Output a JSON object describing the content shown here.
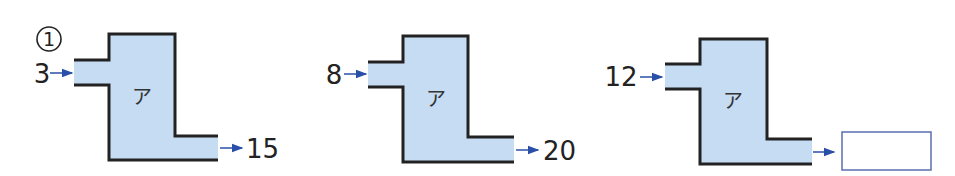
{
  "problem_number": "①",
  "fill_color": "#c5dcf3",
  "stroke_color": "#222222",
  "arrow_color": "#2a4fa8",
  "machines": [
    {
      "label": "ア",
      "input": "3",
      "output": "15"
    },
    {
      "label": "ア",
      "input": "8",
      "output": "20"
    },
    {
      "label": "ア",
      "input": "12",
      "output": ""
    }
  ]
}
